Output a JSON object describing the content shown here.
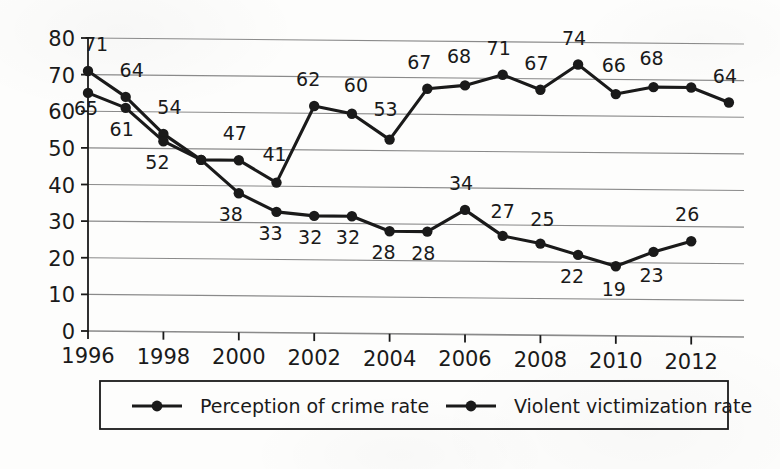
{
  "chart_data": {
    "type": "line",
    "title": "",
    "subtitle": "",
    "xlabel": "",
    "ylabel": "",
    "x": [
      1996,
      1997,
      1998,
      1999,
      2000,
      2001,
      2002,
      2003,
      2004,
      2005,
      2006,
      2007,
      2008,
      2009,
      2010,
      2011,
      2012,
      2013
    ],
    "xlim": [
      1996,
      2013.4
    ],
    "ylim": [
      0,
      80
    ],
    "ytick_labels": [
      "0",
      "10",
      "20",
      "30",
      "40",
      "50",
      "60",
      "70",
      "80"
    ],
    "ytick_values": [
      0,
      10,
      20,
      30,
      40,
      50,
      60,
      70,
      80
    ],
    "xtick_labels": [
      "1996",
      "1998",
      "2000",
      "2002",
      "2004",
      "2006",
      "2008",
      "2010",
      "2012"
    ],
    "xtick_values": [
      1996,
      1998,
      2000,
      2002,
      2004,
      2006,
      2008,
      2010,
      2012
    ],
    "grid": true,
    "grid_axis": "y",
    "legend_position": "bottom",
    "series": [
      {
        "name": "Perception of crime rate",
        "color": "#1a1a1a",
        "x": [
          1996,
          1997,
          1998,
          1999,
          2000,
          2001,
          2002,
          2003,
          2004,
          2005,
          2006,
          2007,
          2008,
          2009,
          2010,
          2011,
          2012,
          2013
        ],
        "values": [
          71,
          64,
          54,
          47,
          47,
          41,
          62,
          60,
          53,
          67,
          68,
          71,
          67,
          74,
          66,
          68,
          68,
          64
        ],
        "labeled_points": [
          {
            "x": 1996,
            "value": 71,
            "label": "71",
            "dx": 8,
            "dy": -20
          },
          {
            "x": 1997,
            "value": 64,
            "label": "64",
            "dx": 6,
            "dy": -20
          },
          {
            "x": 1998,
            "value": 54,
            "label": "54",
            "dx": 6,
            "dy": -20
          },
          {
            "x": 2000,
            "value": 47,
            "label": "47",
            "dx": -4,
            "dy": -20
          },
          {
            "x": 2001,
            "value": 41,
            "label": "41",
            "dx": -2,
            "dy": -22
          },
          {
            "x": 2002,
            "value": 62,
            "label": "62",
            "dx": -6,
            "dy": -20
          },
          {
            "x": 2003,
            "value": 60,
            "label": "60",
            "dx": 4,
            "dy": -22
          },
          {
            "x": 2004,
            "value": 53,
            "label": "53",
            "dx": -4,
            "dy": -24
          },
          {
            "x": 2005,
            "value": 67,
            "label": "67",
            "dx": -8,
            "dy": -20
          },
          {
            "x": 2006,
            "value": 68,
            "label": "68",
            "dx": -6,
            "dy": -22
          },
          {
            "x": 2007,
            "value": 71,
            "label": "71",
            "dx": -4,
            "dy": -20
          },
          {
            "x": 2008,
            "value": 67,
            "label": "67",
            "dx": -4,
            "dy": -20
          },
          {
            "x": 2009,
            "value": 74,
            "label": "74",
            "dx": -4,
            "dy": -20
          },
          {
            "x": 2010,
            "value": 66,
            "label": "66",
            "dx": -2,
            "dy": -22
          },
          {
            "x": 2011,
            "value": 68,
            "label": "68",
            "dx": -2,
            "dy": -22
          },
          {
            "x": 2013,
            "value": 64,
            "label": "64",
            "dx": -4,
            "dy": -20
          }
        ]
      },
      {
        "name": "Violent victimization rate",
        "color": "#1a1a1a",
        "x": [
          1996,
          1997,
          1998,
          1999,
          2000,
          2001,
          2002,
          2003,
          2004,
          2005,
          2006,
          2007,
          2008,
          2009,
          2010,
          2011,
          2012
        ],
        "values": [
          65,
          61,
          52,
          47,
          38,
          33,
          32,
          32,
          28,
          28,
          34,
          27,
          25,
          22,
          19,
          23,
          26
        ],
        "labeled_points": [
          {
            "x": 1996,
            "value": 65,
            "label": "65",
            "dx": -2,
            "dy": 22
          },
          {
            "x": 1997,
            "value": 61,
            "label": "61",
            "dx": -4,
            "dy": 28
          },
          {
            "x": 1998,
            "value": 52,
            "label": "52",
            "dx": -6,
            "dy": 28
          },
          {
            "x": 2000,
            "value": 38,
            "label": "38",
            "dx": -8,
            "dy": 28
          },
          {
            "x": 2001,
            "value": 33,
            "label": "33",
            "dx": -6,
            "dy": 28
          },
          {
            "x": 2002,
            "value": 32,
            "label": "32",
            "dx": -4,
            "dy": 28
          },
          {
            "x": 2003,
            "value": 32,
            "label": "32",
            "dx": -4,
            "dy": 28
          },
          {
            "x": 2004,
            "value": 28,
            "label": "28",
            "dx": -6,
            "dy": 28
          },
          {
            "x": 2005,
            "value": 28,
            "label": "28",
            "dx": -4,
            "dy": 28
          },
          {
            "x": 2006,
            "value": 34,
            "label": "34",
            "dx": -4,
            "dy": -20
          },
          {
            "x": 2007,
            "value": 27,
            "label": "27",
            "dx": 0,
            "dy": -18
          },
          {
            "x": 2008,
            "value": 25,
            "label": "25",
            "dx": 2,
            "dy": -18
          },
          {
            "x": 2009,
            "value": 22,
            "label": "22",
            "dx": -6,
            "dy": 28
          },
          {
            "x": 2010,
            "value": 19,
            "label": "19",
            "dx": -2,
            "dy": 30
          },
          {
            "x": 2011,
            "value": 23,
            "label": "23",
            "dx": -2,
            "dy": 30
          },
          {
            "x": 2012,
            "value": 26,
            "label": "26",
            "dx": -4,
            "dy": -20
          }
        ]
      }
    ]
  },
  "legend": {
    "items": [
      {
        "label": "Perception of crime rate",
        "marker": "line-with-dot-marker"
      },
      {
        "label": "Violent victimization rate",
        "marker": "line-with-dot-marker"
      }
    ]
  },
  "colors": {
    "ink": "#1a1a1a",
    "gridline": "#8a8a8a",
    "axis": "#1a1a1a",
    "paper": "#fdfdfc"
  }
}
